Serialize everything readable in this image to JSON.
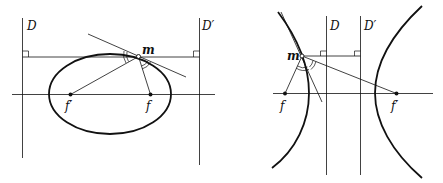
{
  "colors": {
    "ink": "#111111",
    "background": "#ffffff"
  },
  "figures": [
    {
      "name": "ellipse",
      "labels": {
        "directrix_left": "D",
        "directrix_right": "D′",
        "point": "m",
        "focus_left": "f′",
        "focus_right": "f"
      }
    },
    {
      "name": "hyperbola",
      "labels": {
        "directrix_left": "D",
        "directrix_right": "D′",
        "point": "m",
        "focus_left": "f",
        "focus_right": "f′"
      }
    }
  ]
}
